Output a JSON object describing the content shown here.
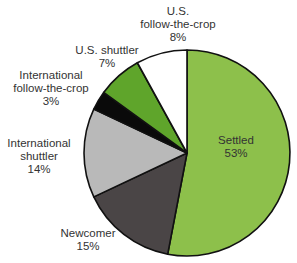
{
  "chart_data": {
    "type": "pie",
    "title": "",
    "start_angle_deg": 0,
    "direction": "clockwise",
    "slices": [
      {
        "label": "Settled",
        "value": 53,
        "display": "53%",
        "color": "#8dc04b"
      },
      {
        "label": "Newcomer",
        "value": 15,
        "display": "15%",
        "color": "#4a4546"
      },
      {
        "label": "International shuttler",
        "value": 14,
        "display": "14%",
        "color": "#b9b9b9"
      },
      {
        "label": "International follow-the-crop",
        "value": 3,
        "display": "3%",
        "color": "#0a0a0a"
      },
      {
        "label": "U.S. shuttler",
        "value": 7,
        "display": "7%",
        "color": "#5fa52b"
      },
      {
        "label": "U.S. follow-the-crop",
        "value": 8,
        "display": "8%",
        "color": "#ffffff"
      }
    ],
    "categories": [
      "Settled",
      "Newcomer",
      "International shuttler",
      "International follow-the-crop",
      "U.S. shuttler",
      "U.S. follow-the-crop"
    ],
    "values": [
      53,
      15,
      14,
      3,
      7,
      8
    ],
    "unit": "%"
  },
  "labels": {
    "settled": {
      "line1": "Settled",
      "pct": "53%"
    },
    "newcomer": {
      "line1": "Newcomer",
      "pct": "15%"
    },
    "intl_shuttler": {
      "line1": "International",
      "line2": "shuttler",
      "pct": "14%"
    },
    "intl_ftc": {
      "line1": "International",
      "line2": "follow-the-crop",
      "pct": "3%"
    },
    "us_shuttler": {
      "line1": "U.S. shuttler",
      "pct": "7%"
    },
    "us_ftc": {
      "line1": "U.S.",
      "line2": "follow-the-crop",
      "pct": "8%"
    }
  }
}
